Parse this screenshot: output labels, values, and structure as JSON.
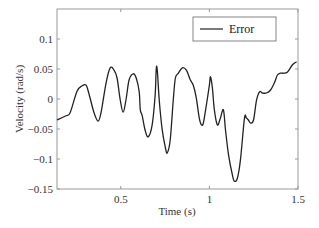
{
  "chart_data": {
    "type": "line",
    "title": "",
    "xlabel": "Time (s)",
    "ylabel": "Velocity (rad/s)",
    "xlim": [
      0.14,
      1.5
    ],
    "ylim": [
      -0.15,
      0.15
    ],
    "grid": false,
    "legend_position": "upper right",
    "x_ticks": [
      0.5,
      1,
      1.5
    ],
    "x_tick_labels": [
      "0.5",
      "1",
      "1.5"
    ],
    "y_ticks": [
      -0.15,
      -0.1,
      -0.05,
      0,
      0.05,
      0.1
    ],
    "y_tick_labels": [
      "−0.15",
      "−0.1",
      "−0.05",
      "0",
      "0.05",
      "0.1"
    ],
    "series": [
      {
        "name": "Error",
        "color": "#222222",
        "x": [
          0.14,
          0.191,
          0.214,
          0.253,
          0.282,
          0.304,
          0.321,
          0.349,
          0.372,
          0.389,
          0.417,
          0.44,
          0.462,
          0.479,
          0.496,
          0.513,
          0.53,
          0.547,
          0.57,
          0.587,
          0.604,
          0.61,
          0.621,
          0.638,
          0.655,
          0.677,
          0.694,
          0.7,
          0.706,
          0.717,
          0.734,
          0.751,
          0.762,
          0.779,
          0.796,
          0.808,
          0.825,
          0.847,
          0.87,
          0.892,
          0.909,
          0.926,
          0.943,
          0.955,
          0.966,
          0.983,
          1.0,
          1.006,
          1.017,
          1.028,
          1.045,
          1.062,
          1.079,
          1.091,
          1.108,
          1.13,
          1.141,
          1.158,
          1.175,
          1.198,
          1.209,
          1.22,
          1.232,
          1.249,
          1.266,
          1.283,
          1.3,
          1.322,
          1.345,
          1.367,
          1.384,
          1.401,
          1.418,
          1.441,
          1.469,
          1.492
        ],
        "y": [
          -0.035,
          -0.028,
          -0.023,
          0.013,
          0.022,
          0.023,
          0.008,
          -0.023,
          -0.037,
          -0.022,
          0.027,
          0.052,
          0.048,
          0.035,
          0.0,
          -0.022,
          0.0,
          0.032,
          0.042,
          0.035,
          0.012,
          -0.018,
          -0.028,
          -0.053,
          -0.063,
          -0.043,
          0.007,
          0.05,
          0.048,
          -0.002,
          -0.052,
          -0.08,
          -0.09,
          -0.068,
          -0.002,
          0.035,
          0.043,
          0.052,
          0.048,
          0.032,
          0.023,
          0.002,
          -0.032,
          -0.043,
          -0.04,
          -0.01,
          0.023,
          0.037,
          0.018,
          -0.018,
          -0.043,
          -0.032,
          -0.018,
          -0.052,
          -0.093,
          -0.127,
          -0.137,
          -0.132,
          -0.102,
          -0.032,
          -0.032,
          -0.035,
          -0.04,
          -0.035,
          -0.002,
          0.012,
          0.01,
          0.01,
          0.015,
          0.027,
          0.04,
          0.043,
          0.043,
          0.045,
          0.057,
          0.062
        ]
      }
    ]
  },
  "legend": {
    "items": [
      {
        "label": "Error",
        "color": "#222222"
      }
    ]
  },
  "axes": {
    "xlabel": "Time (s)",
    "ylabel": "Velocity (rad/s)"
  }
}
